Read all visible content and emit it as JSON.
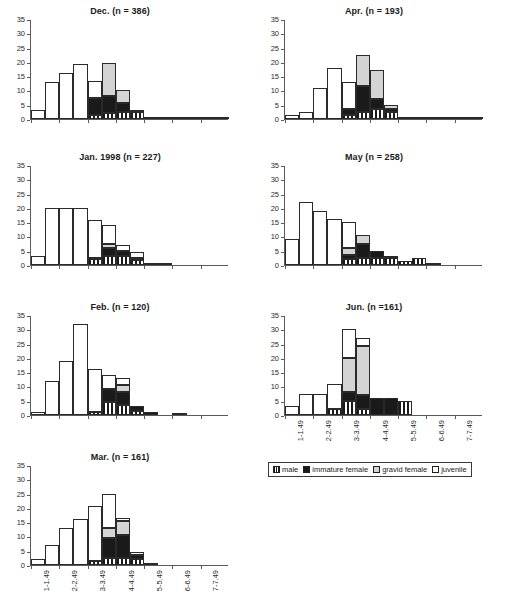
{
  "chart_data": {
    "type": "bar",
    "xlabel": "",
    "ylabel": "",
    "ylim": [
      0,
      35
    ],
    "yticks": [
      0,
      5,
      10,
      15,
      20,
      25,
      30,
      35
    ],
    "grid": false,
    "stacked": true,
    "legend_position": "bottom-right",
    "categories": [
      "1-1.49",
      "1.5-1.99",
      "2-2.49",
      "2.5-2.99",
      "3-3.49",
      "3.5-3.99",
      "4-4.49",
      "4.5-4.99",
      "5-5.49",
      "5.5-5.99",
      "6-6.49",
      "6.5-6.99",
      "7-7.49",
      "7.5-7.99"
    ],
    "axis_tick_labels": [
      "1-1.49",
      "2-2.49",
      "3-3.49",
      "4-4.49",
      "5-5.49",
      "6-6.49",
      "7-7.49"
    ],
    "series_names": [
      "male",
      "immature female",
      "gravid female",
      "juvenile"
    ],
    "panels": [
      {
        "id": "dec",
        "title": "Dec.  (n = 386)",
        "month": "Dec.",
        "n": 386,
        "series": [
          {
            "name": "juvenile",
            "values": [
              3,
              13,
              16,
              19.3,
              6,
              0,
              0,
              0,
              0,
              0,
              0,
              0,
              0,
              0
            ]
          },
          {
            "name": "gravid female",
            "values": [
              0,
              0,
              0,
              0,
              0,
              11.5,
              4.5,
              0,
              0,
              0,
              0,
              0,
              0,
              0
            ]
          },
          {
            "name": "immature female",
            "values": [
              0,
              0,
              0,
              0,
              6,
              6,
              3,
              0.7,
              0.5,
              0.4,
              0.4,
              0.3,
              0.3,
              0.2
            ]
          },
          {
            "name": "male",
            "values": [
              0,
              0,
              0,
              0,
              1.3,
              2,
              2.5,
              2.6,
              0,
              0,
              0,
              0,
              0,
              0
            ]
          }
        ]
      },
      {
        "id": "jan",
        "title": "Jan. 1998 (n = 227)",
        "month": "Jan. 1998",
        "n": 227,
        "series": [
          {
            "name": "juvenile",
            "values": [
              3,
              20,
              20,
              20,
              13,
              6.5,
              2,
              2,
              0,
              0,
              0,
              0,
              0,
              0
            ]
          },
          {
            "name": "gravid female",
            "values": [
              0,
              0,
              0,
              0,
              0,
              1.5,
              0,
              0,
              0,
              0,
              0,
              0,
              0,
              0
            ]
          },
          {
            "name": "immature female",
            "values": [
              0,
              0,
              0,
              0,
              0.6,
              3,
              2,
              0.8,
              0.5,
              0.4,
              0,
              0,
              0,
              0
            ]
          },
          {
            "name": "male",
            "values": [
              0,
              0,
              0,
              0,
              2,
              3,
              3,
              1.6,
              0,
              0,
              0,
              0,
              0,
              0
            ]
          }
        ]
      },
      {
        "id": "feb",
        "title": "Feb.  (n = 120)",
        "month": "Feb.",
        "n": 120,
        "series": [
          {
            "name": "juvenile",
            "values": [
              1,
              12,
              19,
              32,
              15,
              5,
              2.5,
              0,
              0,
              0,
              0,
              0,
              0,
              0
            ]
          },
          {
            "name": "gravid female",
            "values": [
              0,
              0,
              0,
              0,
              0,
              0,
              2.5,
              0,
              0,
              0,
              0,
              0,
              0,
              0
            ]
          },
          {
            "name": "immature female",
            "values": [
              0,
              0,
              0,
              0,
              0,
              4.5,
              4.5,
              1.5,
              1.2,
              0,
              0.8,
              0,
              0,
              0
            ]
          },
          {
            "name": "male",
            "values": [
              0,
              0,
              0,
              0,
              1,
              4.5,
              3.5,
              1.5,
              0,
              0,
              0,
              0,
              0,
              0
            ]
          }
        ]
      },
      {
        "id": "mar",
        "title": "Mar.  (n = 161)",
        "month": "Mar.",
        "n": 161,
        "series": [
          {
            "name": "juvenile",
            "values": [
              2,
              7,
              13,
              16,
              19,
              12,
              1,
              1,
              0.6,
              0,
              0,
              0,
              0,
              0
            ]
          },
          {
            "name": "gravid female",
            "values": [
              0,
              0,
              0,
              0,
              0,
              3.5,
              5,
              0,
              0,
              0,
              0,
              0,
              0,
              0
            ]
          },
          {
            "name": "immature female",
            "values": [
              0,
              0,
              0,
              0,
              0,
              7,
              8,
              1.5,
              0,
              0,
              0,
              0,
              0,
              0
            ]
          },
          {
            "name": "male",
            "values": [
              0,
              0,
              0,
              0,
              1.5,
              2.5,
              2.5,
              2,
              0,
              0,
              0,
              0,
              0,
              0
            ]
          }
        ]
      },
      {
        "id": "apr",
        "title": "Apr.  (n = 193)",
        "month": "Apr.",
        "n": 193,
        "series": [
          {
            "name": "juvenile",
            "values": [
              1.5,
              2.5,
              11,
              18,
              9.5,
              0,
              0,
              0,
              0,
              0,
              0,
              0,
              0,
              0
            ]
          },
          {
            "name": "gravid female",
            "values": [
              0,
              0,
              0,
              0,
              0,
              11,
              10,
              1.5,
              0,
              0,
              0,
              0,
              0,
              0
            ]
          },
          {
            "name": "immature female",
            "values": [
              0,
              0,
              0,
              0,
              2,
              9,
              3.5,
              1,
              0.8,
              0.6,
              0.6,
              0.5,
              0.4,
              0.3
            ]
          },
          {
            "name": "male",
            "values": [
              0,
              0,
              0,
              0,
              1.5,
              2.5,
              3.5,
              2.5,
              0,
              0,
              0,
              0,
              0,
              0
            ]
          }
        ]
      },
      {
        "id": "may",
        "title": "May  (n = 258)",
        "month": "May",
        "n": 258,
        "series": [
          {
            "name": "juvenile",
            "values": [
              9,
              22,
              19,
              16,
              9,
              0,
              0,
              0,
              0,
              0,
              0,
              0,
              0,
              0
            ]
          },
          {
            "name": "gravid female",
            "values": [
              0,
              0,
              0,
              0,
              2.5,
              3,
              0,
              0,
              0,
              0,
              0,
              0,
              0,
              0
            ]
          },
          {
            "name": "immature female",
            "values": [
              0,
              0,
              0,
              0,
              1.5,
              5,
              2.5,
              0.6,
              0,
              0,
              0,
              0,
              0,
              0
            ]
          },
          {
            "name": "male",
            "values": [
              0,
              0,
              0,
              0,
              2,
              2.5,
              2.5,
              2.5,
              1.5,
              2.5,
              0.5,
              0,
              0,
              0
            ]
          }
        ]
      },
      {
        "id": "jun",
        "title": "Jun. (n =161)",
        "month": "Jun.",
        "n": 161,
        "series": [
          {
            "name": "juvenile",
            "values": [
              3,
              7.5,
              7.5,
              9,
              10,
              3,
              0,
              0,
              0,
              0,
              0,
              0,
              0,
              0
            ]
          },
          {
            "name": "gravid female",
            "values": [
              0,
              0,
              0,
              0,
              12,
              17,
              0,
              0,
              0,
              0,
              0,
              0,
              0,
              0
            ]
          },
          {
            "name": "immature female",
            "values": [
              0,
              0,
              0,
              0,
              3,
              5,
              6,
              6,
              0,
              0,
              0,
              0,
              0,
              0
            ]
          },
          {
            "name": "male",
            "values": [
              0,
              0,
              0,
              2,
              5,
              2,
              0,
              0,
              5,
              0,
              0,
              0,
              0,
              0
            ]
          }
        ]
      }
    ]
  },
  "legend": {
    "items": [
      {
        "label": "male",
        "key": "male"
      },
      {
        "label": "immature female",
        "key": "immature"
      },
      {
        "label": "gravid female",
        "key": "gravid"
      },
      {
        "label": "juvenile",
        "key": "juvenile"
      }
    ]
  },
  "caption": {
    "text": ""
  },
  "colors": {
    "juvenile": "#ffffff",
    "gravid": "#d4d4d4",
    "immature": "#1a1a1a",
    "male_stripe": "#1a1a1a",
    "axis": "#5a5a5a",
    "text": "#1a1a1a"
  }
}
